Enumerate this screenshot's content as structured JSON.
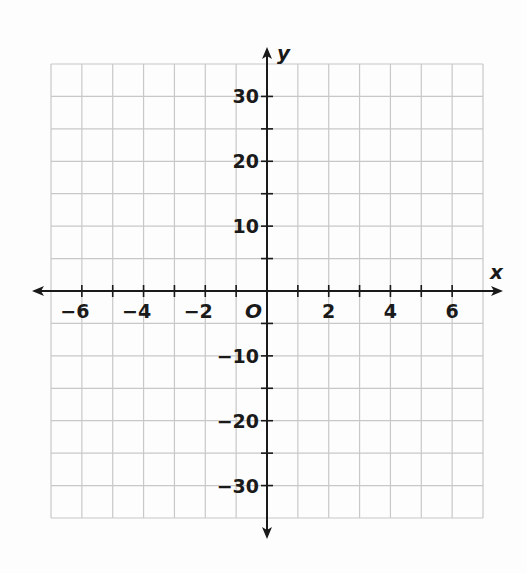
{
  "chart_data": {
    "type": "line",
    "title": "",
    "xlabel": "x",
    "ylabel": "y",
    "origin_label": "O",
    "xlim": [
      -7,
      7
    ],
    "ylim": [
      -35,
      35
    ],
    "grid": true,
    "x_grid_step": 1,
    "y_grid_step": 5,
    "x_ticks": [
      -6,
      -4,
      -2,
      2,
      4,
      6
    ],
    "x_tick_labels": [
      "−6",
      "−4",
      "−2",
      "2",
      "4",
      "6"
    ],
    "y_ticks": [
      30,
      20,
      10,
      -10,
      -20,
      -30
    ],
    "y_tick_labels": [
      "30",
      "20",
      "10",
      "−10",
      "−20",
      "−30"
    ],
    "series": [],
    "colors": {
      "grid": "#c8c8c8",
      "axis": "#1a1a1a",
      "background": "#fdfdfd"
    }
  }
}
